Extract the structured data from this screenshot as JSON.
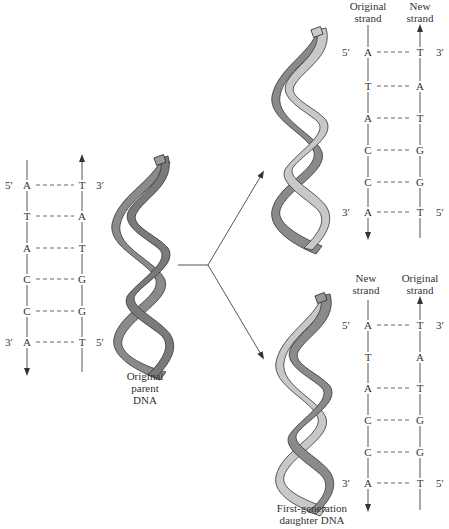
{
  "figure": {
    "parent": {
      "caption_lines": [
        "Original",
        "parent",
        "DNA"
      ],
      "ladder": {
        "left_strand_top": "5′",
        "left_strand_bottom": "3′",
        "right_strand_top": "3′",
        "right_strand_bottom": "5′",
        "pairs": [
          {
            "left": "A",
            "right": "T",
            "bonded": true
          },
          {
            "left": "T",
            "right": "A",
            "bonded": true
          },
          {
            "left": "A",
            "right": "T",
            "bonded": true
          },
          {
            "left": "C",
            "right": "G",
            "bonded": true
          },
          {
            "left": "C",
            "right": "G",
            "bonded": true
          },
          {
            "left": "A",
            "right": "T",
            "bonded": true
          }
        ]
      }
    },
    "daughter_top": {
      "left_header": [
        "Original",
        "strand"
      ],
      "right_header": [
        "New",
        "strand"
      ],
      "left_strand_top": "5′",
      "left_strand_bottom": "3′",
      "right_strand_top": "3′",
      "right_strand_bottom": "5′",
      "pairs": [
        {
          "left": "A",
          "right": "T",
          "bonded": true
        },
        {
          "left": "T",
          "right": "A",
          "bonded": true
        },
        {
          "left": "A",
          "right": "T",
          "bonded": true
        },
        {
          "left": "C",
          "right": "G",
          "bonded": true
        },
        {
          "left": "C",
          "right": "G",
          "bonded": true
        },
        {
          "left": "A",
          "right": "T",
          "bonded": true
        }
      ]
    },
    "daughter_bottom": {
      "left_header": [
        "New",
        "strand"
      ],
      "right_header": [
        "Original",
        "strand"
      ],
      "left_strand_top": "5′",
      "left_strand_bottom": "3′",
      "right_strand_top": "3′",
      "right_strand_bottom": "5′",
      "pairs": [
        {
          "left": "A",
          "right": "T",
          "bonded": true
        },
        {
          "left": "T",
          "right": "A",
          "bonded": false
        },
        {
          "left": "A",
          "right": "T",
          "bonded": true
        },
        {
          "left": "C",
          "right": "G",
          "bonded": true
        },
        {
          "left": "C",
          "right": "G",
          "bonded": true
        },
        {
          "left": "A",
          "right": "T",
          "bonded": true
        }
      ]
    },
    "daughter_caption_lines": [
      "First-generation",
      "daughter DNA"
    ],
    "colors": {
      "original_strand": "#8a8a8a",
      "new_strand": "#c8c8c8",
      "outline": "#3a3a3a",
      "line": "#555555"
    }
  }
}
